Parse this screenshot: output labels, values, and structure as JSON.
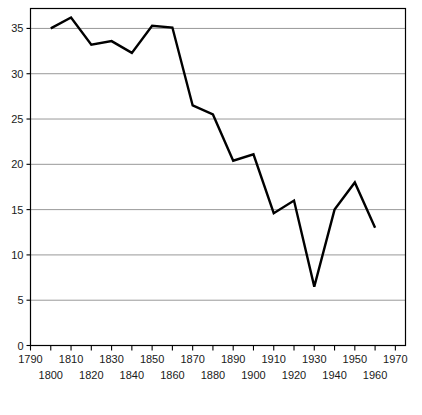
{
  "chart_data": {
    "type": "line",
    "title": "",
    "subtitle": "",
    "xlabel": "",
    "ylabel": "",
    "xlim": [
      1790,
      1975
    ],
    "ylim": [
      0,
      37.2
    ],
    "grid": true,
    "grid_axis": "y",
    "legend": false,
    "legend_position": "none",
    "line_color": "#000000",
    "line_width": 2.4,
    "grid_color": "#8c8c8c",
    "axis_color": "#000000",
    "background": "#ffffff",
    "x": [
      1800,
      1810,
      1820,
      1830,
      1840,
      1850,
      1860,
      1870,
      1880,
      1890,
      1900,
      1910,
      1920,
      1930,
      1940,
      1950,
      1960,
      1970
    ],
    "values": [
      35.0,
      36.2,
      33.2,
      33.6,
      32.3,
      35.3,
      35.1,
      26.5,
      25.5,
      20.4,
      21.1,
      14.6,
      16.0,
      6.5,
      15.0,
      18.0,
      13.0,
      null
    ],
    "series": [
      {
        "name": "series-1",
        "points": [
          {
            "x": 1800,
            "y": 35.0
          },
          {
            "x": 1810,
            "y": 36.2
          },
          {
            "x": 1820,
            "y": 33.2
          },
          {
            "x": 1830,
            "y": 33.6
          },
          {
            "x": 1840,
            "y": 32.3
          },
          {
            "x": 1850,
            "y": 35.3
          },
          {
            "x": 1860,
            "y": 35.1
          },
          {
            "x": 1870,
            "y": 26.5
          },
          {
            "x": 1880,
            "y": 25.5
          },
          {
            "x": 1890,
            "y": 20.4
          },
          {
            "x": 1900,
            "y": 21.1
          },
          {
            "x": 1910,
            "y": 14.6
          },
          {
            "x": 1920,
            "y": 16.0
          },
          {
            "x": 1930,
            "y": 6.5
          },
          {
            "x": 1940,
            "y": 15.0
          },
          {
            "x": 1950,
            "y": 18.0
          },
          {
            "x": 1960,
            "y": 13.0
          }
        ]
      }
    ],
    "y_ticks": [
      5,
      10,
      15,
      20,
      25,
      30,
      35
    ],
    "y_tick_labels": [
      "5",
      "10",
      "15",
      "20",
      "25",
      "30",
      "35"
    ],
    "y_axis_zero_label": "0",
    "x_ticks": [
      1790,
      1800,
      1810,
      1820,
      1830,
      1840,
      1850,
      1860,
      1870,
      1880,
      1890,
      1900,
      1910,
      1920,
      1930,
      1940,
      1950,
      1960,
      1970
    ],
    "x_tick_labels_upper": [
      "1790",
      "1810",
      "1830",
      "1850",
      "1870",
      "1890",
      "1910",
      "1930",
      "1950",
      "1970"
    ],
    "x_tick_labels_lower": [
      "1800",
      "1820",
      "1840",
      "1860",
      "1880",
      "1900",
      "1920",
      "1940",
      "1960"
    ],
    "x_tick_values_upper": [
      1790,
      1810,
      1830,
      1850,
      1870,
      1890,
      1910,
      1930,
      1950,
      1970
    ],
    "x_tick_values_lower": [
      1800,
      1820,
      1840,
      1860,
      1880,
      1900,
      1920,
      1940,
      1960
    ]
  }
}
